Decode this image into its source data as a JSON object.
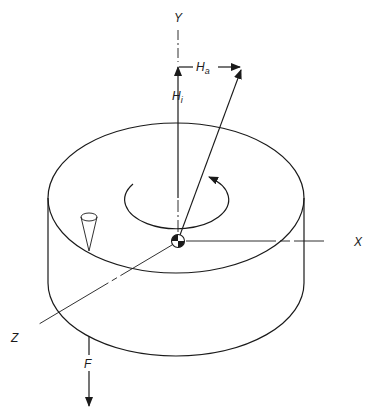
{
  "diagram": {
    "type": "isometric cylinder with gyroscopic vectors",
    "colors": {
      "ink": "#1a1a1a",
      "background": "#ffffff"
    },
    "axes": {
      "y": {
        "label": "Y"
      },
      "x": {
        "label": "X"
      },
      "z": {
        "label": "Z"
      }
    },
    "vectors": {
      "h_i": {
        "symbol": "H",
        "subscript": "i"
      },
      "h_a": {
        "symbol": "H",
        "subscript": "a"
      },
      "force": {
        "label": "F"
      }
    },
    "elements": [
      "cylinder-body",
      "cylinder-top-ellipse",
      "rotation-arrow",
      "center-of-gravity-symbol",
      "cone-marker",
      "resultant-vector"
    ]
  }
}
